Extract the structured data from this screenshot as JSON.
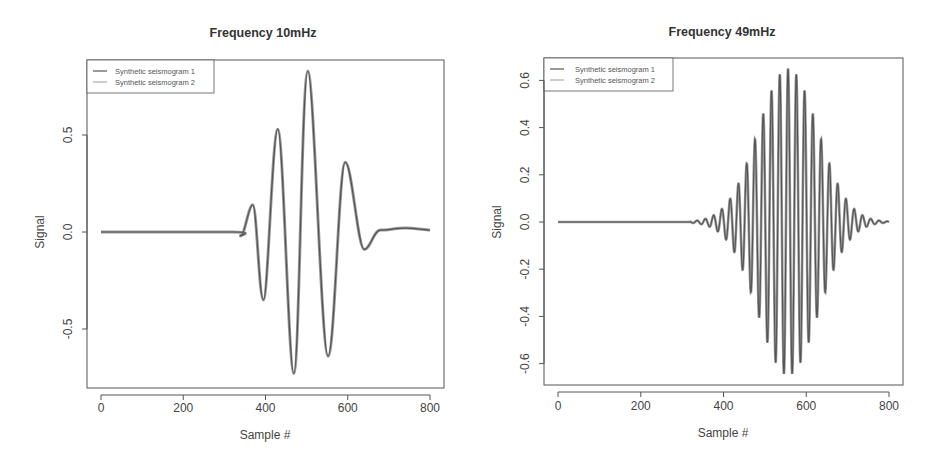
{
  "chart_data": [
    {
      "type": "line",
      "title": "Frequency 10mHz",
      "xlabel": "Sample #",
      "ylabel": "Signal",
      "xlim": [
        0,
        800
      ],
      "ylim": [
        -0.8,
        0.88
      ],
      "xticks": [
        0,
        200,
        400,
        600,
        800
      ],
      "xtick_labels": [
        "0",
        "200",
        "400",
        "600",
        "800"
      ],
      "yticks": [
        -0.5,
        0.0,
        0.5
      ],
      "ytick_labels": [
        "-0.5",
        "0.0",
        "0.5"
      ],
      "grid": false,
      "legend": {
        "position": "top-left",
        "entries": [
          "Synthetic seismogram 1",
          "Synthetic seismogram 2"
        ]
      },
      "series": [
        {
          "name": "Synthetic seismogram 1",
          "color": "#555555"
        },
        {
          "name": "Synthetic seismogram 2",
          "color": "#9a9a9a"
        }
      ],
      "key_points": {
        "x": [
          0,
          320,
          340,
          369,
          395,
          430,
          469,
          503,
          552,
          594,
          640,
          680,
          740,
          800
        ],
        "y": [
          0.0,
          0.0,
          -0.02,
          0.14,
          -0.35,
          0.53,
          -0.73,
          0.83,
          -0.64,
          0.36,
          -0.09,
          0.01,
          0.02,
          0.01
        ]
      }
    },
    {
      "type": "line",
      "title": "Frequency 49mHz",
      "xlabel": "Sample #",
      "ylabel": "Signal",
      "xlim": [
        0,
        800
      ],
      "ylim": [
        -0.69,
        0.69
      ],
      "xticks": [
        0,
        200,
        400,
        600,
        800
      ],
      "xtick_labels": [
        "0",
        "200",
        "400",
        "600",
        "800"
      ],
      "yticks": [
        -0.6,
        -0.4,
        -0.2,
        0.0,
        0.2,
        0.4,
        0.6
      ],
      "ytick_labels": [
        "-0.6",
        "-0.4",
        "-0.2",
        "0.0",
        "0.2",
        "0.4",
        "0.6"
      ],
      "grid": false,
      "legend": {
        "position": "top-left",
        "entries": [
          "Synthetic seismogram 1",
          "Synthetic seismogram 2"
        ]
      },
      "series": [
        {
          "name": "Synthetic seismogram 1",
          "color": "#555555"
        },
        {
          "name": "Synthetic seismogram 2",
          "color": "#9a9a9a"
        }
      ],
      "waveform": {
        "description": "Gaussian-modulated sinusoid",
        "center_sample": 556,
        "peak_amplitude": 0.65,
        "period_samples": 20,
        "envelope_sigma_samples": 72,
        "onset_sample": 320,
        "end_sample": 800
      },
      "key_points": {
        "peaks_y": [
          0.08,
          0.15,
          0.24,
          0.35,
          0.47,
          0.57,
          0.64,
          0.65,
          0.59,
          0.48,
          0.34,
          0.22,
          0.12,
          0.06
        ],
        "troughs_y": [
          -0.09,
          -0.18,
          -0.29,
          -0.4,
          -0.52,
          -0.6,
          -0.65,
          -0.61,
          -0.52,
          -0.4,
          -0.27,
          -0.15,
          -0.07
        ]
      }
    }
  ],
  "plots": [
    {
      "title": "Frequency 10mHz",
      "xlabel": "Sample #",
      "ylabel": "Signal",
      "legend": [
        "Synthetic seismogram 1",
        "Synthetic seismogram 2"
      ]
    },
    {
      "title": "Frequency 49mHz",
      "xlabel": "Sample #",
      "ylabel": "Signal",
      "legend": [
        "Synthetic seismogram 1",
        "Synthetic seismogram 2"
      ]
    }
  ]
}
